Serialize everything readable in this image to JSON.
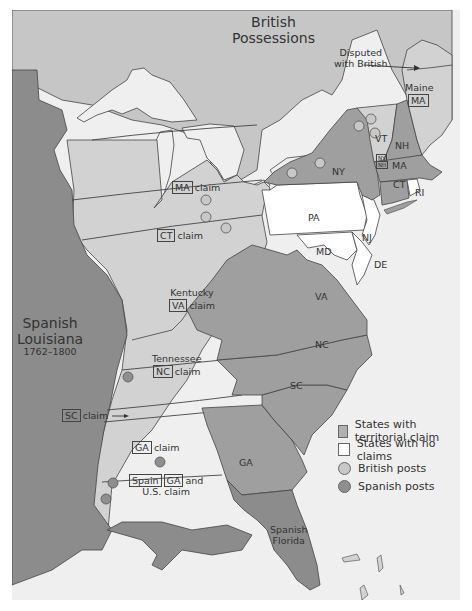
{
  "colors": {
    "background": "#efefef",
    "spanish_territory": "#8c8c8c",
    "british_territory": "#c6c6c6",
    "states_with_claim": "#9f9f9f",
    "claimed_lands": "#d2d2d2",
    "states_no_claims": "#ffffff",
    "water": "#efefef",
    "british_post": "#c8c8c8",
    "spanish_post": "#8f8f8f",
    "border": "#444444"
  },
  "regions": {
    "british": {
      "line1": "British",
      "line2": "Possessions"
    },
    "disputed": {
      "line1": "Disputed",
      "line2": "with British"
    },
    "spanish_louisiana": {
      "line1": "Spanish",
      "line2": "Louisiana",
      "years": "1762–1800"
    },
    "spanish_florida": {
      "line1": "Spanish",
      "line2": "Florida"
    }
  },
  "states": {
    "maine": {
      "name": "Maine",
      "owner": "MA"
    },
    "vt": {
      "name": "VT",
      "claim1": "NY",
      "claim2": "NH"
    },
    "nh": "NH",
    "ny": "NY",
    "ma": "MA",
    "ct": "CT",
    "ri": "RI",
    "pa": "PA",
    "nj": "NJ",
    "md": "MD",
    "de": "DE",
    "va": "VA",
    "nc": "NC",
    "sc": "SC",
    "ga": "GA"
  },
  "claims": {
    "ma": {
      "state": "MA",
      "text": "claim"
    },
    "ct": {
      "state": "CT",
      "text": "claim"
    },
    "kentucky": {
      "name": "Kentucky",
      "state": "VA",
      "text": "claim"
    },
    "tennessee": {
      "name": "Tennessee",
      "state": "NC",
      "text": "claim"
    },
    "sc": {
      "state": "SC",
      "text": "claim"
    },
    "ga": {
      "state": "GA",
      "text": "claim"
    },
    "yazoo": {
      "state1": "Spain",
      "state2": "GA",
      "text1": "and",
      "text2": "U.S. claim"
    }
  },
  "legend": {
    "items": [
      {
        "label": "States with territorial claim",
        "symbol": "square",
        "color": "#b0b0b0"
      },
      {
        "label": "States with no claims",
        "symbol": "square",
        "color": "#ffffff"
      },
      {
        "label": "British posts",
        "symbol": "circle",
        "color": "#c8c8c8"
      },
      {
        "label": "Spanish posts",
        "symbol": "circle",
        "color": "#8f8f8f"
      }
    ]
  }
}
